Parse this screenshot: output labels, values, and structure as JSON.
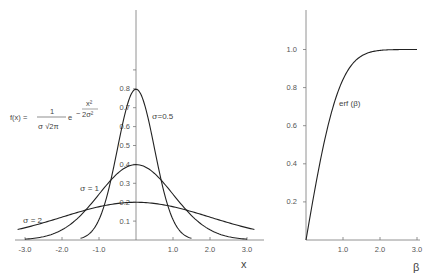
{
  "chart_data": [
    {
      "type": "line",
      "title": "",
      "formula": {
        "lhs": "f(x) =",
        "numerator": "1",
        "denominator_sigma": "σ",
        "denominator_rest": "√2π",
        "e": "e",
        "exp_sign": "−",
        "exp_numerator": "x²",
        "exp_denominator": "2σ²"
      },
      "xlabel": "x",
      "ylabel": "",
      "xlim": [
        -3.2,
        3.4
      ],
      "ylim": [
        0,
        1.0
      ],
      "x_ticks": [
        -3.0,
        -2.0,
        -1.0,
        1.0,
        2.0,
        3.0
      ],
      "x_tick_labels": [
        "-3.0",
        "-2.0",
        "-1.0",
        "1.0",
        "2.0",
        "3.0"
      ],
      "y_ticks": [
        0.1,
        0.2,
        0.3,
        0.4,
        0.5,
        0.6,
        0.7,
        0.8,
        0.9
      ],
      "y_tick_labels": [
        "0.1",
        "0.2",
        "0.3",
        "0.4",
        "0.5",
        "0.6",
        "0.7",
        "0.8",
        ""
      ],
      "grid": false,
      "series": [
        {
          "name": "σ=0.5",
          "sigma": 0.5,
          "x_range": [
            -1.5,
            1.5
          ],
          "peak": 0.798
        },
        {
          "name": "σ=1",
          "sigma": 1.0,
          "x_range": [
            -3.0,
            3.0
          ],
          "peak": 0.399
        },
        {
          "name": "σ=2",
          "sigma": 2.0,
          "x_range": [
            -3.2,
            3.2
          ],
          "peak": 0.199
        }
      ],
      "annotations": [
        {
          "text": "σ=0.5",
          "x": 0.55,
          "y": 0.7
        },
        {
          "text": "σ = 1",
          "x": -1.0,
          "y": 0.32
        },
        {
          "text": "σ = 2",
          "x": -3.0,
          "y": 0.16
        }
      ]
    },
    {
      "type": "line",
      "title": "",
      "xlabel": "β",
      "ylabel": "",
      "xlim": [
        0,
        3.1
      ],
      "ylim": [
        0,
        1.2
      ],
      "x_ticks": [
        1.0,
        2.0,
        3.0
      ],
      "x_tick_labels": [
        "1.0",
        "2.0",
        "3.0"
      ],
      "y_ticks": [
        0.2,
        0.4,
        0.6,
        0.8,
        1.0
      ],
      "y_tick_labels": [
        "0.2",
        "0.4",
        "0.6",
        "0.8",
        "1.0"
      ],
      "grid": false,
      "series": [
        {
          "name": "erf (β)",
          "x": [
            0,
            0.2,
            0.4,
            0.6,
            0.8,
            1.0,
            1.2,
            1.4,
            1.6,
            1.8,
            2.0,
            2.5,
            3.0
          ],
          "values": [
            0,
            0.223,
            0.428,
            0.604,
            0.742,
            0.843,
            0.91,
            0.952,
            0.976,
            0.989,
            0.995,
            0.9996,
            1.0
          ]
        }
      ],
      "annotations": [
        {
          "text": "erf (β)",
          "x": 1.25,
          "y": 0.72
        }
      ]
    }
  ]
}
